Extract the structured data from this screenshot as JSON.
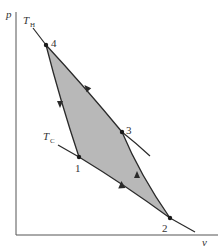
{
  "diagram": {
    "type": "pv-cycle",
    "axes": {
      "y_label": "p",
      "x_label": "v"
    },
    "isotherms": [
      {
        "label": "T",
        "subscript": "H",
        "name": "hot-isotherm"
      },
      {
        "label": "T",
        "subscript": "C",
        "name": "cold-isotherm"
      }
    ],
    "points": [
      {
        "id": "1",
        "label": "1"
      },
      {
        "id": "2",
        "label": "2"
      },
      {
        "id": "3",
        "label": "3"
      },
      {
        "id": "4",
        "label": "4"
      }
    ],
    "fill_color": "#b8b8b8",
    "line_color": "#2a2a2a"
  }
}
